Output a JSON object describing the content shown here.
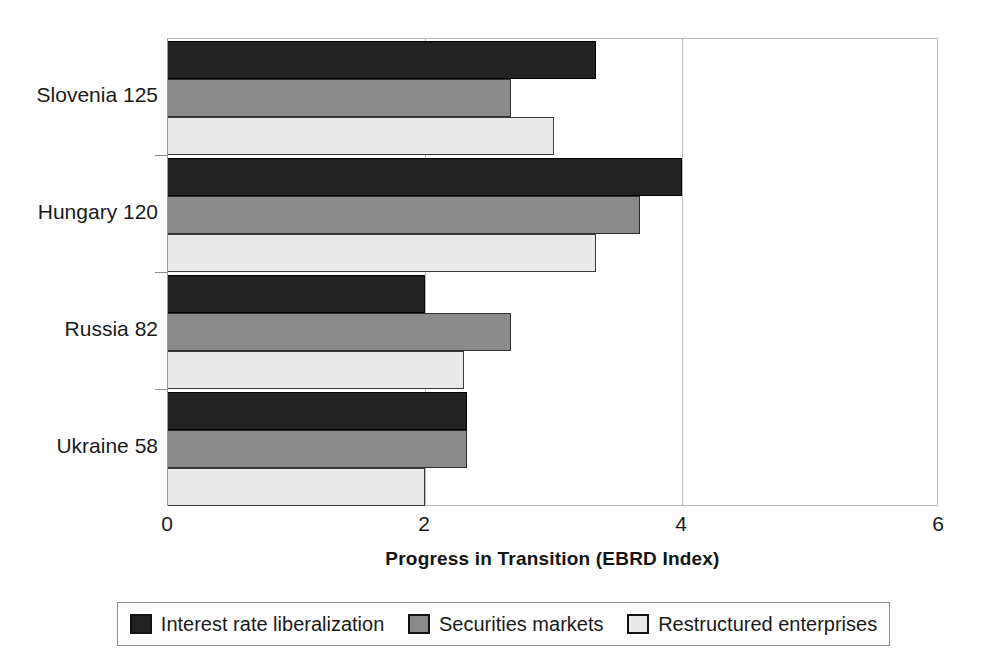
{
  "chart_data": {
    "type": "bar",
    "orientation": "horizontal",
    "title": "",
    "xlabel": "Progress in Transition (EBRD Index)",
    "ylabel": "",
    "xlim": [
      0,
      6
    ],
    "xticks": [
      "0",
      "2",
      "4",
      "6"
    ],
    "xtick_values": [
      0,
      2,
      4,
      6
    ],
    "grid": true,
    "grid_axis": "x",
    "legend_position": "bottom",
    "categories": [
      "Slovenia 125",
      "Hungary 120",
      "Russia 82",
      "Ukraine 58"
    ],
    "series": [
      {
        "name": "Interest rate liberalization",
        "color": "#222222",
        "values": [
          3.33,
          4.0,
          2.0,
          2.33
        ]
      },
      {
        "name": "Securities markets",
        "color": "#8a8a8a",
        "values": [
          2.67,
          3.67,
          2.67,
          2.33
        ]
      },
      {
        "name": "Restructured enterprises",
        "color": "#e9e9e9",
        "values": [
          3.0,
          3.33,
          2.3,
          2.0
        ]
      }
    ]
  },
  "axis": {
    "x_title": "Progress in Transition (EBRD Index)"
  }
}
